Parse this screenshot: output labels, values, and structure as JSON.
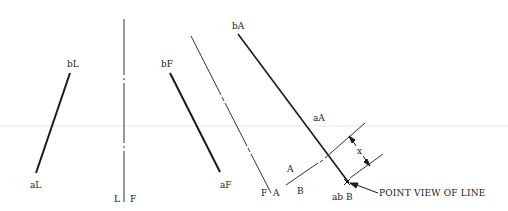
{
  "diagram": {
    "labels": {
      "bL": "bL",
      "aL": "aL",
      "bF": "bF",
      "aF": "aF",
      "bA": "bA",
      "aA": "aA",
      "fold_LF_left": "L",
      "fold_LF_right": "F",
      "fold_FA_left": "F",
      "fold_FA_right": "A",
      "fold_AB_upper": "A",
      "fold_AB_lower": "B",
      "abB": "ab B",
      "dimension_x": "x",
      "callout": "POINT VIEW OF LINE"
    },
    "views": [
      {
        "name": "left-view",
        "line": "aL-bL"
      },
      {
        "name": "front-view",
        "line": "aF-bF"
      },
      {
        "name": "auxiliary-view-A",
        "line": "aA-bA"
      },
      {
        "name": "auxiliary-view-B",
        "line": "point ab"
      }
    ],
    "fold_lines": [
      "L|F",
      "F|A",
      "A|B"
    ],
    "colors": {
      "line": "#1a1a1a",
      "thin_line": "#333333",
      "guide": "#e6e6e6",
      "background": "#ffffff"
    }
  }
}
